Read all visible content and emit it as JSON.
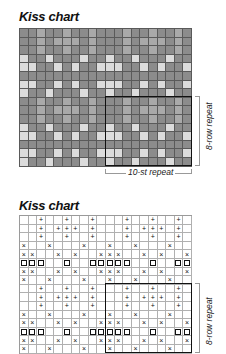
{
  "colors": {
    "blank": "#8c8c8c",
    "plus": "#a9a9a9",
    "cross": "#dcdcdc",
    "square": "#8c8c8c"
  },
  "symbols": {
    "blank": "",
    "plus": "+",
    "cross": "×",
    "square": "□"
  },
  "pattern_rows": [
    "..+..+..+...+..+..+.",
    "..+.+++.+...+.+++.+.",
    "..+..+..+...+..+..+.",
    "x..x...x..x..x...x..",
    "xx..x.x..xxx..x.x..x",
    "sss..s..sssss..s..ss",
    "xx..x.x..xxx..x.x..x",
    "x..x...x..x..x...x.."
  ],
  "top_chart": {
    "title": "Kiss chart",
    "rows": 16,
    "cols": 20,
    "row_repeat_label": "8-row repeat",
    "stitch_repeat_label": "10-st repeat"
  },
  "bottom_chart": {
    "title": "Kiss chart",
    "rows": 16,
    "cols": 20,
    "row_repeat_label": "8-row repeat"
  }
}
